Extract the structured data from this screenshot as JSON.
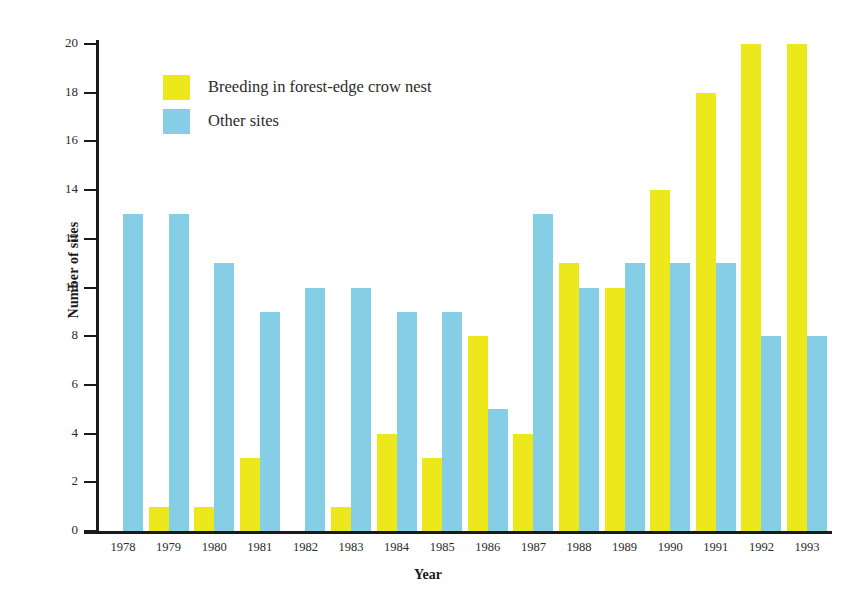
{
  "chart_data": {
    "type": "bar",
    "title": "",
    "xlabel": "Year",
    "ylabel": "Number of sites",
    "ylim": [
      0,
      20
    ],
    "ytick_step": 2,
    "yticks": [
      0,
      2,
      4,
      6,
      8,
      10,
      12,
      14,
      16,
      18,
      20
    ],
    "grid": false,
    "legend_position": "upper-left-inside",
    "categories": [
      "1978",
      "1979",
      "1980",
      "1981",
      "1982",
      "1983",
      "1984",
      "1985",
      "1986",
      "1987",
      "1988",
      "1989",
      "1990",
      "1991",
      "1992",
      "1993"
    ],
    "series": [
      {
        "name": "Breeding in forest-edge crow nest",
        "color": "#ede81b",
        "values": [
          0,
          1,
          1,
          3,
          0,
          1,
          4,
          3,
          8,
          4,
          11,
          10,
          14,
          18,
          20,
          20
        ]
      },
      {
        "name": "Other sites",
        "color": "#85cee6",
        "values": [
          13,
          13,
          11,
          9,
          10,
          10,
          9,
          9,
          5,
          13,
          10,
          11,
          11,
          11,
          8,
          8
        ]
      }
    ]
  },
  "legend": {
    "items": [
      {
        "label": "Breeding in forest-edge crow nest",
        "color": "#ede81b"
      },
      {
        "label": "Other sites",
        "color": "#85cee6"
      }
    ]
  },
  "axes": {
    "y_title": "Number of sites",
    "x_title": "Year"
  },
  "colors": {
    "yellow": "#ede81b",
    "blue": "#85cee6",
    "axis": "#1a1a1a",
    "text": "#2b2b2b",
    "background": "#ffffff"
  }
}
